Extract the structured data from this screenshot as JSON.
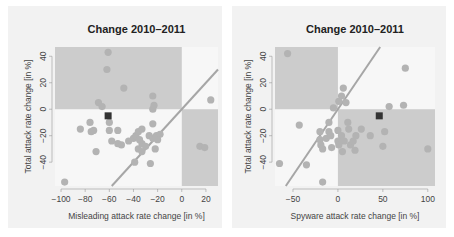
{
  "colors": {
    "panel_bg": "#f2f2f2",
    "plot_bg": "#f7f7f7",
    "shade": "#cccccc",
    "points": "#b3b3b3",
    "highlight": "#333333",
    "diagonal": "#a6a6a6"
  },
  "chart_data": [
    {
      "type": "scatter",
      "title": "Change 2010–2011",
      "xlabel": "Misleading attack rate change [in %]",
      "ylabel": "Total attack rate change [in %]",
      "xlim": [
        -105,
        30
      ],
      "ylim": [
        -58,
        47
      ],
      "xticks": [
        -100,
        -80,
        -60,
        -40,
        -20,
        0,
        20
      ],
      "yticks": [
        -40,
        -20,
        0,
        20,
        40
      ],
      "grid": false,
      "shaded_regions": [
        {
          "x": [
            -105,
            0
          ],
          "y": [
            0,
            47
          ]
        },
        {
          "x": [
            0,
            30
          ],
          "y": [
            -58,
            0
          ]
        }
      ],
      "diagonal": "y = x",
      "highlight_point": {
        "x": -61,
        "y": -5
      },
      "points": [
        {
          "x": -61,
          "y": 43
        },
        {
          "x": -62,
          "y": 30
        },
        {
          "x": -48,
          "y": 16
        },
        {
          "x": -69,
          "y": 5
        },
        {
          "x": -66,
          "y": 2
        },
        {
          "x": -24,
          "y": 10
        },
        {
          "x": -23,
          "y": 3
        },
        {
          "x": -24,
          "y": 0
        },
        {
          "x": 24,
          "y": 7
        },
        {
          "x": -60,
          "y": -10
        },
        {
          "x": -76,
          "y": -10
        },
        {
          "x": -84,
          "y": -15
        },
        {
          "x": -75,
          "y": -17
        },
        {
          "x": -73,
          "y": -16
        },
        {
          "x": -60,
          "y": -16
        },
        {
          "x": -53,
          "y": -16
        },
        {
          "x": -24,
          "y": -11
        },
        {
          "x": -58,
          "y": -24
        },
        {
          "x": -53,
          "y": -26
        },
        {
          "x": -50,
          "y": -27
        },
        {
          "x": -44,
          "y": -24
        },
        {
          "x": -40,
          "y": -22
        },
        {
          "x": -38,
          "y": -20
        },
        {
          "x": -36,
          "y": -17
        },
        {
          "x": -33,
          "y": -15
        },
        {
          "x": -35,
          "y": -23
        },
        {
          "x": -33,
          "y": -26
        },
        {
          "x": -30,
          "y": -28
        },
        {
          "x": -27,
          "y": -20
        },
        {
          "x": -24,
          "y": -22
        },
        {
          "x": -21,
          "y": -20
        },
        {
          "x": -18,
          "y": -19
        },
        {
          "x": -20,
          "y": -23
        },
        {
          "x": -36,
          "y": -30
        },
        {
          "x": -33,
          "y": -32
        },
        {
          "x": -22,
          "y": -30
        },
        {
          "x": -71,
          "y": -32
        },
        {
          "x": -39,
          "y": -40
        },
        {
          "x": -26,
          "y": -41
        },
        {
          "x": -97,
          "y": -55
        },
        {
          "x": 15,
          "y": -28
        },
        {
          "x": 19,
          "y": -29
        }
      ]
    },
    {
      "type": "scatter",
      "title": "Change 2010–2011",
      "xlabel": "Spyware attack rate change [in %]",
      "ylabel": "Total attack rate change [in %]",
      "xlim": [
        -70,
        108
      ],
      "ylim": [
        -58,
        47
      ],
      "xticks": [
        -50,
        0,
        50,
        100
      ],
      "yticks": [
        -40,
        -20,
        0,
        20,
        40
      ],
      "grid": false,
      "shaded_regions": [
        {
          "x": [
            -70,
            0
          ],
          "y": [
            0,
            47
          ]
        },
        {
          "x": [
            0,
            108
          ],
          "y": [
            -58,
            0
          ]
        }
      ],
      "diagonal": "y = x",
      "highlight_point": {
        "x": 46,
        "y": -5
      },
      "points": [
        {
          "x": -56,
          "y": 42
        },
        {
          "x": 75,
          "y": 31
        },
        {
          "x": 6,
          "y": 16
        },
        {
          "x": 4,
          "y": 10
        },
        {
          "x": 1,
          "y": 6
        },
        {
          "x": 9,
          "y": 5
        },
        {
          "x": -5,
          "y": 1
        },
        {
          "x": 57,
          "y": 2
        },
        {
          "x": 73,
          "y": 3
        },
        {
          "x": -43,
          "y": -12
        },
        {
          "x": -10,
          "y": -10
        },
        {
          "x": 11,
          "y": -10
        },
        {
          "x": -20,
          "y": -17
        },
        {
          "x": -10,
          "y": -17
        },
        {
          "x": 0,
          "y": -16
        },
        {
          "x": 4,
          "y": -20
        },
        {
          "x": 12,
          "y": -15
        },
        {
          "x": 26,
          "y": -15
        },
        {
          "x": 20,
          "y": -20
        },
        {
          "x": 36,
          "y": -20
        },
        {
          "x": 52,
          "y": -17
        },
        {
          "x": -20,
          "y": -23
        },
        {
          "x": -13,
          "y": -22
        },
        {
          "x": -8,
          "y": -20
        },
        {
          "x": -19,
          "y": -27
        },
        {
          "x": 0,
          "y": -24
        },
        {
          "x": 7,
          "y": -24
        },
        {
          "x": 1,
          "y": -27
        },
        {
          "x": 14,
          "y": -27
        },
        {
          "x": 17,
          "y": -24
        },
        {
          "x": 50,
          "y": -28
        },
        {
          "x": -17,
          "y": -30
        },
        {
          "x": -7,
          "y": -29
        },
        {
          "x": 5,
          "y": -32
        },
        {
          "x": 19,
          "y": -31
        },
        {
          "x": 100,
          "y": -30
        },
        {
          "x": -65,
          "y": -41
        },
        {
          "x": -35,
          "y": -42
        },
        {
          "x": -17,
          "y": -55
        }
      ]
    }
  ]
}
